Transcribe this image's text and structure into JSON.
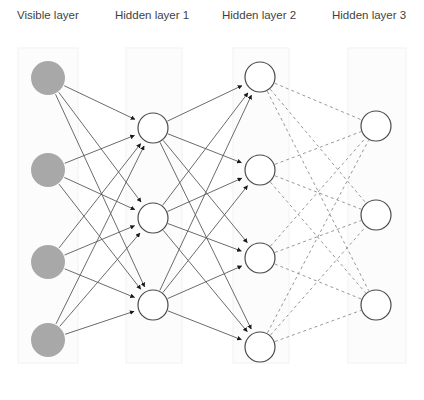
{
  "diagram": {
    "background_color": "#ffffff",
    "width": 424,
    "height": 400,
    "label_color": "#3f3f3f",
    "panel_fill": "#fcfcfc",
    "panel_stroke": "#f2f2f2",
    "visible_node_fill": "#a8a8a8",
    "visible_node_stroke": "#a8a8a8",
    "hidden_node_fill": "#ffffff",
    "hidden_node_stroke": "#4a4a4a",
    "solid_edge_color": "#5a5a5a",
    "dashed_edge_color": "#8c8c8c",
    "arrow_color": "#1a1a1a",
    "dash_pattern": "3,3"
  },
  "labels": [
    {
      "id": "visible-layer",
      "text": "Visible layer",
      "x": 17,
      "y": 19
    },
    {
      "id": "hidden-layer-1",
      "text": "Hidden layer 1",
      "x": 115,
      "y": 19
    },
    {
      "id": "hidden-layer-2",
      "text": "Hidden layer 2",
      "x": 222,
      "y": 19
    },
    {
      "id": "hidden-layer-3",
      "text": "Hidden layer 3",
      "x": 332,
      "y": 19
    }
  ],
  "panels": [
    {
      "id": "panel-visible",
      "x": 18,
      "y": 48,
      "width": 60,
      "height": 315
    },
    {
      "id": "panel-hidden-1",
      "x": 126,
      "y": 48,
      "width": 56,
      "height": 315
    },
    {
      "id": "panel-hidden-2",
      "x": 233,
      "y": 48,
      "width": 56,
      "height": 315
    },
    {
      "id": "panel-hidden-3",
      "x": 348,
      "y": 48,
      "width": 58,
      "height": 315
    }
  ],
  "layers": [
    {
      "id": "visible-layer",
      "name": "Visible layer",
      "kind": "visible",
      "node_count": 4,
      "node_radius": 17,
      "nodes": [
        {
          "id": "v1",
          "cx": 48,
          "cy": 78
        },
        {
          "id": "v2",
          "cx": 48,
          "cy": 170
        },
        {
          "id": "v3",
          "cx": 48,
          "cy": 262
        },
        {
          "id": "v4",
          "cx": 48,
          "cy": 340
        }
      ]
    },
    {
      "id": "hidden-layer-1",
      "name": "Hidden layer 1",
      "kind": "hidden",
      "node_count": 3,
      "node_radius": 15,
      "nodes": [
        {
          "id": "h1a",
          "cx": 153,
          "cy": 128
        },
        {
          "id": "h1b",
          "cx": 153,
          "cy": 218
        },
        {
          "id": "h1c",
          "cx": 153,
          "cy": 305
        }
      ]
    },
    {
      "id": "hidden-layer-2",
      "name": "Hidden layer 2",
      "kind": "hidden",
      "node_count": 4,
      "node_radius": 15,
      "nodes": [
        {
          "id": "h2a",
          "cx": 260,
          "cy": 77
        },
        {
          "id": "h2b",
          "cx": 260,
          "cy": 170
        },
        {
          "id": "h2c",
          "cx": 260,
          "cy": 258
        },
        {
          "id": "h2d",
          "cx": 260,
          "cy": 347
        }
      ]
    },
    {
      "id": "hidden-layer-3",
      "name": "Hidden layer 3",
      "kind": "hidden",
      "node_count": 3,
      "node_radius": 15,
      "nodes": [
        {
          "id": "h3a",
          "cx": 376,
          "cy": 126
        },
        {
          "id": "h3b",
          "cx": 376,
          "cy": 215
        },
        {
          "id": "h3c",
          "cx": 376,
          "cy": 305
        }
      ]
    }
  ],
  "edge_groups": [
    {
      "id": "visible-to-hidden1",
      "from_layer": "visible-layer",
      "to_layer": "hidden-layer-1",
      "style": "solid",
      "arrowhead": true,
      "count": 12
    },
    {
      "id": "hidden1-to-hidden2",
      "from_layer": "hidden-layer-1",
      "to_layer": "hidden-layer-2",
      "style": "solid",
      "arrowhead": true,
      "count": 12
    },
    {
      "id": "hidden2-to-hidden3",
      "from_layer": "hidden-layer-2",
      "to_layer": "hidden-layer-3",
      "style": "dashed",
      "arrowhead": false,
      "count": 12
    }
  ]
}
